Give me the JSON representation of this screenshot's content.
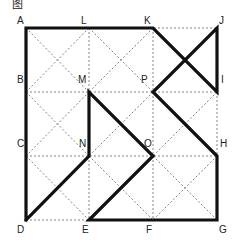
{
  "title": "图",
  "grid": {
    "cols": [
      26,
      89,
      153,
      217
    ],
    "rows": [
      28,
      92,
      156,
      220
    ],
    "dotted_color": "#666666",
    "bold_color": "#111111"
  },
  "points": {
    "A": [
      26,
      28
    ],
    "L": [
      89,
      28
    ],
    "K": [
      153,
      28
    ],
    "J": [
      217,
      28
    ],
    "B": [
      26,
      92
    ],
    "M": [
      89,
      92
    ],
    "P": [
      153,
      92
    ],
    "I": [
      217,
      92
    ],
    "C": [
      26,
      156
    ],
    "N": [
      89,
      156
    ],
    "O": [
      153,
      156
    ],
    "H": [
      217,
      156
    ],
    "D": [
      26,
      220
    ],
    "E": [
      89,
      220
    ],
    "F": [
      153,
      220
    ],
    "G": [
      217,
      220
    ]
  },
  "labels": [
    {
      "name": "A",
      "x": 17,
      "y": 24
    },
    {
      "name": "L",
      "x": 81,
      "y": 24
    },
    {
      "name": "K",
      "x": 144,
      "y": 24
    },
    {
      "name": "J",
      "x": 219,
      "y": 24
    },
    {
      "name": "B",
      "x": 17,
      "y": 83
    },
    {
      "name": "M",
      "x": 78,
      "y": 83
    },
    {
      "name": "P",
      "x": 141,
      "y": 83
    },
    {
      "name": "I",
      "x": 221,
      "y": 83
    },
    {
      "name": "C",
      "x": 17,
      "y": 147
    },
    {
      "name": "N",
      "x": 79,
      "y": 147
    },
    {
      "name": "O",
      "x": 144,
      "y": 147
    },
    {
      "name": "H",
      "x": 220,
      "y": 147
    },
    {
      "name": "D",
      "x": 17,
      "y": 233
    },
    {
      "name": "E",
      "x": 82,
      "y": 233
    },
    {
      "name": "F",
      "x": 146,
      "y": 233
    },
    {
      "name": "G",
      "x": 219,
      "y": 233
    }
  ],
  "bold_path": [
    "D",
    "A",
    "K",
    "I",
    "J",
    "P",
    "H",
    "G",
    "E",
    "O",
    "M",
    "N",
    "D"
  ]
}
